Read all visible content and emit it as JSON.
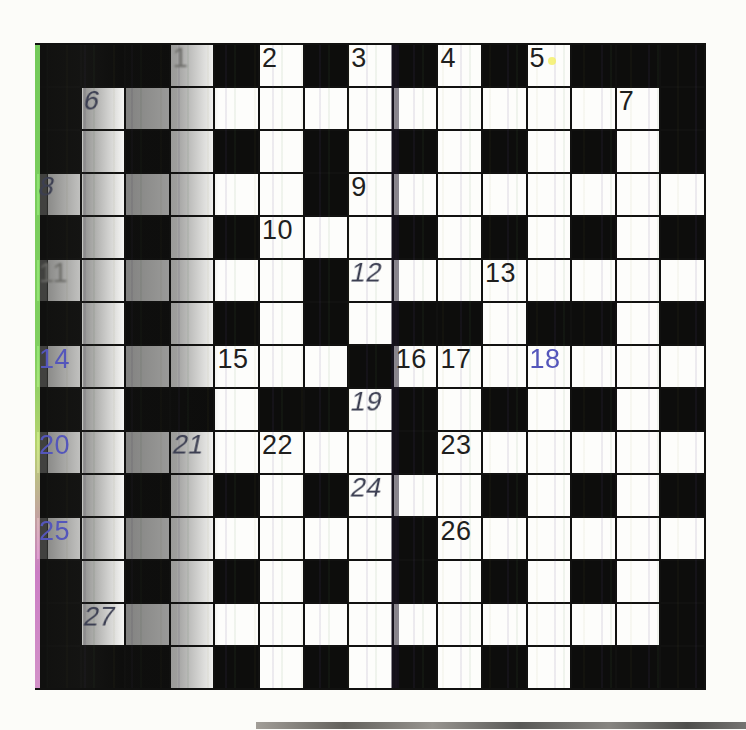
{
  "page": {
    "kind": "scanned crossword puzzle grid"
  },
  "crossword": {
    "size": 15,
    "cell_black": "B",
    "cell_white": "W",
    "rows": [
      "BBBWBWBWBWBWBBB",
      "BWWWWWWWWWWWWWB",
      "BWBWBWBWBWBWBWB",
      "WWWWWWBWWWWWWWW",
      "BWBWBWWWBWBWBWB",
      "WWWWWWBWWWWWWWW",
      "BWBWBWBWBBWBBWB",
      "WWWWWWWBWWWWWWW",
      "BWBBWBBWBWBWBWB",
      "WWWWWWWWBWWWWWW",
      "BWBWBWBWWWBWBWB",
      "WWWWWWWWBWWWWWW",
      "BWBWBWBWBWBWBWB",
      "BWWWWWWWWWWWWWB",
      "BBBWBWBWBWBWBBB"
    ],
    "numbers": [
      {
        "row": 0,
        "col": 3,
        "label": "1",
        "tint": "faint"
      },
      {
        "row": 0,
        "col": 5,
        "label": "2",
        "tint": "dark"
      },
      {
        "row": 0,
        "col": 7,
        "label": "3",
        "tint": "dark"
      },
      {
        "row": 0,
        "col": 9,
        "label": "4",
        "tint": "dark"
      },
      {
        "row": 0,
        "col": 11,
        "label": "5",
        "tint": "dark"
      },
      {
        "row": 1,
        "col": 1,
        "label": "6",
        "tint": "smudged"
      },
      {
        "row": 1,
        "col": 13,
        "label": "7",
        "tint": "dark"
      },
      {
        "row": 3,
        "col": 0,
        "label": "8",
        "tint": "smudged"
      },
      {
        "row": 3,
        "col": 7,
        "label": "9",
        "tint": "dark"
      },
      {
        "row": 4,
        "col": 5,
        "label": "10",
        "tint": "dark"
      },
      {
        "row": 5,
        "col": 0,
        "label": "11",
        "tint": "faint"
      },
      {
        "row": 5,
        "col": 7,
        "label": "12",
        "tint": "smudged"
      },
      {
        "row": 5,
        "col": 10,
        "label": "13",
        "tint": "dark"
      },
      {
        "row": 7,
        "col": 0,
        "label": "14",
        "tint": "blue"
      },
      {
        "row": 7,
        "col": 4,
        "label": "15",
        "tint": "dark"
      },
      {
        "row": 7,
        "col": 8,
        "label": "16",
        "tint": "dark"
      },
      {
        "row": 7,
        "col": 9,
        "label": "17",
        "tint": "dark"
      },
      {
        "row": 7,
        "col": 11,
        "label": "18",
        "tint": "blue"
      },
      {
        "row": 8,
        "col": 7,
        "label": "19",
        "tint": "smudged"
      },
      {
        "row": 9,
        "col": 0,
        "label": "20",
        "tint": "blue"
      },
      {
        "row": 9,
        "col": 3,
        "label": "21",
        "tint": "smudged"
      },
      {
        "row": 9,
        "col": 5,
        "label": "22",
        "tint": "dark"
      },
      {
        "row": 9,
        "col": 9,
        "label": "23",
        "tint": "dark"
      },
      {
        "row": 10,
        "col": 7,
        "label": "24",
        "tint": "smudged"
      },
      {
        "row": 11,
        "col": 0,
        "label": "25",
        "tint": "blue"
      },
      {
        "row": 11,
        "col": 9,
        "label": "26",
        "tint": "dark"
      },
      {
        "row": 13,
        "col": 1,
        "label": "27",
        "tint": "smudged"
      }
    ]
  },
  "colors": {
    "page_bg": "#fcfcf9",
    "black_cell": "#0d0d0c",
    "white_cell": "#fdfdfb",
    "grid_line": "#111110",
    "number_dark": "#1f1f1e",
    "number_blue": "#5456bb",
    "number_smudged": "#3c3f52",
    "number_faint": "#6a6a66",
    "scan_green_edge": "#7ede62",
    "scan_magenta_edge": "#e08ad8",
    "speck_yellow": "#f5f06a"
  }
}
